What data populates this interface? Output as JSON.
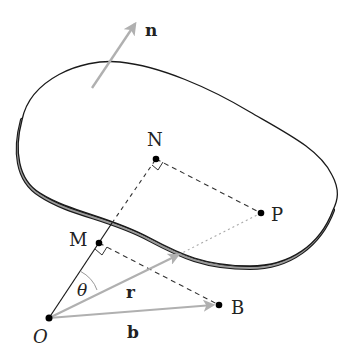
{
  "diagram": {
    "type": "geometry-surface-projection",
    "labels": {
      "normal": "n",
      "N": "N",
      "P": "P",
      "M": "M",
      "O": "O",
      "B": "B",
      "theta": "θ",
      "r": "r",
      "b": "b"
    },
    "colors": {
      "outline": "#1a1a1a",
      "edge_fill": "#9a9a9a",
      "vector": "#b0b0b0",
      "point": "#000000",
      "dashed": "#333333",
      "dotted": "#aaaaaa"
    },
    "points": {
      "O": [
        49,
        318
      ],
      "M": [
        99,
        243
      ],
      "N": [
        156,
        159
      ],
      "P": [
        261,
        213
      ],
      "B": [
        219,
        305
      ]
    },
    "vectors": [
      {
        "name": "n",
        "from": [
          92,
          88
        ],
        "to": [
          137,
          20
        ]
      },
      {
        "name": "r",
        "from": [
          49,
          318
        ],
        "to": [
          180,
          254
        ]
      },
      {
        "name": "b",
        "from": [
          49,
          318
        ],
        "to": [
          215,
          305
        ]
      }
    ]
  }
}
